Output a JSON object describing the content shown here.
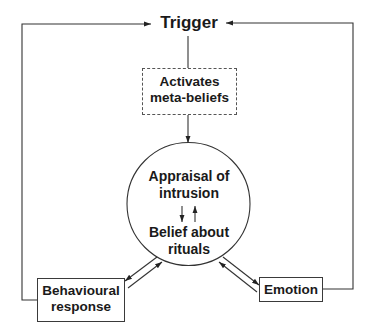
{
  "diagram": {
    "type": "flowchart",
    "title": "",
    "nodes": {
      "trigger": {
        "label": "Trigger",
        "shape": "plain-text"
      },
      "meta_beliefs": {
        "line1": "Activates",
        "line2": "meta-beliefs",
        "shape": "dashed-rectangle"
      },
      "central": {
        "shape": "circle",
        "appraisal_line1": "Appraisal of",
        "appraisal_line2": "intrusion",
        "belief_line1": "Belief about",
        "belief_line2": "rituals"
      },
      "behavioural": {
        "line1": "Behavioural",
        "line2": "response",
        "shape": "rectangle"
      },
      "emotion": {
        "label": "Emotion",
        "shape": "rectangle"
      }
    },
    "edges": [
      {
        "from": "Trigger",
        "to": "Activates meta-beliefs",
        "style": "line"
      },
      {
        "from": "Activates meta-beliefs",
        "to": "Appraisal of intrusion / Belief about rituals",
        "style": "arrow"
      },
      {
        "from": "Appraisal of intrusion",
        "to": "Belief about rituals",
        "style": "bidirectional-pair"
      },
      {
        "from": "Appraisal / Belief circle",
        "to": "Behavioural response",
        "style": "bidirectional-pair"
      },
      {
        "from": "Appraisal / Belief circle",
        "to": "Emotion",
        "style": "bidirectional-pair"
      },
      {
        "from": "Behavioural response",
        "to": "Trigger",
        "style": "feedback-arrow-left-loop"
      },
      {
        "from": "Emotion",
        "to": "Trigger",
        "style": "feedback-arrow-right-loop"
      }
    ],
    "colors": {
      "line": "#333333",
      "text": "#1a1a1a",
      "background": "#ffffff"
    }
  }
}
